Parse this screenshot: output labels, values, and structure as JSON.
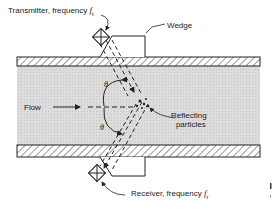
{
  "diagram": {
    "type": "ultrasonic doppler flowmeter cross-section",
    "labels": {
      "transmitter": "Transmitter, frequency",
      "transmitter_symbol": "f",
      "transmitter_sub": "t",
      "receiver": "Receiver, frequency",
      "receiver_symbol": "f",
      "receiver_sub": "r",
      "wedge": "Wedge",
      "flow": "Flow",
      "reflecting_1": "Reflecting",
      "reflecting_2": "particles",
      "theta_top": "θ",
      "theta_bottom": "θ"
    },
    "colors": {
      "line": "#222222",
      "fluid": "#d9d9d9",
      "wall": "#ffffff"
    }
  }
}
